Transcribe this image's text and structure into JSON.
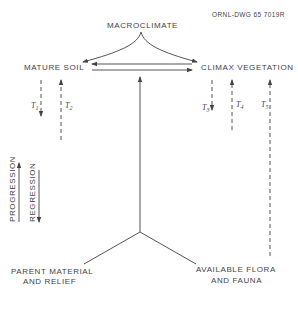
{
  "drawing_id": "ORNL-DWG 65  7019R",
  "nodes": {
    "macroclimate": "MACROCLIMATE",
    "mature_soil": "MATURE SOIL",
    "climax_vegetation": "CLIMAX VEGETATION",
    "parent_material_line1": "PARENT MATERIAL",
    "parent_material_line2": "AND RELIEF",
    "flora_fauna_line1": "AVAILABLE FLORA",
    "flora_fauna_line2": "AND FAUNA"
  },
  "time_labels": {
    "t1": "T1",
    "t2": "T2",
    "t3": "T3",
    "t4": "T4",
    "t5": "T5"
  },
  "t_sub": {
    "t1": "1",
    "t2": "2",
    "t3": "3",
    "t4": "4",
    "t5": "5"
  },
  "legend": {
    "progression": "PROGRESSION",
    "regression": "REGRESSION"
  },
  "edges": [
    {
      "from": "macroclimate",
      "to": "mature_soil",
      "style": "curve-arrow"
    },
    {
      "from": "macroclimate",
      "to": "climax_vegetation",
      "style": "curve-arrow"
    },
    {
      "from": "climax_vegetation",
      "to": "mature_soil",
      "style": "arrow"
    },
    {
      "from": "mature_soil",
      "to": "climax_vegetation",
      "style": "arrow"
    },
    {
      "from": "parent_material_and_flora_junction",
      "to": "between_soil_and_vegetation",
      "style": "arrow"
    },
    {
      "from": "mature_soil",
      "to": "down",
      "label": "T1",
      "style": "dashed-arrow-down"
    },
    {
      "from": "below",
      "to": "mature_soil",
      "label": "T2",
      "style": "dashed-arrow-up"
    },
    {
      "from": "climax_vegetation",
      "to": "down",
      "label": "T3",
      "style": "dashed-arrow-down"
    },
    {
      "from": "below",
      "to": "climax_vegetation",
      "label": "T4",
      "style": "dashed-arrow-up"
    },
    {
      "from": "available_flora_and_fauna",
      "to": "climax_vegetation",
      "label": "T5",
      "style": "dashed-arrow-up"
    }
  ]
}
